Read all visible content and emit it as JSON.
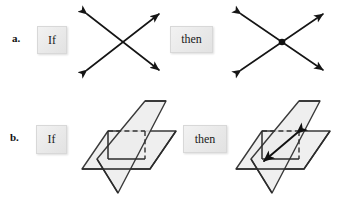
{
  "figure": {
    "background_color": "#ffffff",
    "ink_color": "#151515",
    "plane_fill_color": "#ececec",
    "box_fill_color": "#eeeeee",
    "box_border_color": "#d8d8d8"
  },
  "rows": [
    {
      "letter": "a.",
      "if_label": "If",
      "then_label": "then",
      "premise_icon": "two-intersecting-lines-icon",
      "conclusion_icon": "two-intersecting-lines-with-point-icon",
      "premise_description": "two lines crossing, arrowheads on all four ends",
      "conclusion_description": "two lines crossing with a filled dot at the single point of intersection"
    },
    {
      "letter": "b.",
      "if_label": "If",
      "then_label": "then",
      "premise_icon": "two-intersecting-planes-icon",
      "conclusion_icon": "two-intersecting-planes-with-line-icon",
      "premise_description": "a vertical plane and a horizontal plane passing through each other, hidden edges dashed",
      "conclusion_description": "same two planes with a double headed arrow marking their line of intersection"
    }
  ]
}
